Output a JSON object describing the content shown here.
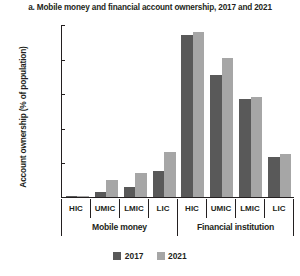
{
  "chart_data": {
    "type": "bar",
    "title": "a. Mobile money and financial account ownership, 2017 and 2021",
    "xlabel": "",
    "ylabel": "Account ownership (% of population)",
    "ylim": [
      0,
      100
    ],
    "yticks": [
      0,
      20,
      40,
      60,
      80,
      100
    ],
    "grid": false,
    "legend_position": "bottom-center",
    "categories": [
      "HIC",
      "UMIC",
      "LMIC",
      "LIC",
      "HIC",
      "UMIC",
      "LMIC",
      "LIC"
    ],
    "groups": [
      {
        "label": "Mobile money",
        "categories": [
          "HIC",
          "UMIC",
          "LMIC",
          "LIC"
        ]
      },
      {
        "label": "Financial institution",
        "categories": [
          "HIC",
          "UMIC",
          "LMIC",
          "LIC"
        ]
      }
    ],
    "series": [
      {
        "name": "2017",
        "color": "#595959",
        "values": [
          0.5,
          3,
          6,
          15,
          94,
          71,
          57,
          23
        ]
      },
      {
        "name": "2021",
        "color": "#a6a6a6",
        "values": [
          0.7,
          10,
          14,
          26,
          96,
          81,
          58,
          25
        ]
      }
    ],
    "bars": [
      {
        "group": "Mobile money",
        "category": "HIC",
        "y2017": 0.5,
        "y2021": 0.7
      },
      {
        "group": "Mobile money",
        "category": "UMIC",
        "y2017": 3,
        "y2021": 10
      },
      {
        "group": "Mobile money",
        "category": "LMIC",
        "y2017": 6,
        "y2021": 14
      },
      {
        "group": "Mobile money",
        "category": "LIC",
        "y2017": 15,
        "y2021": 26
      },
      {
        "group": "Financial institution",
        "category": "HIC",
        "y2017": 94,
        "y2021": 96
      },
      {
        "group": "Financial institution",
        "category": "UMIC",
        "y2017": 71,
        "y2021": 81
      },
      {
        "group": "Financial institution",
        "category": "LMIC",
        "y2017": 57,
        "y2021": 58
      },
      {
        "group": "Financial institution",
        "category": "LIC",
        "y2017": 23,
        "y2021": 25
      }
    ]
  },
  "axis": {
    "ytick_labels": [
      "100",
      "80",
      "60",
      "40",
      "20",
      "0"
    ],
    "ylabel_text": "Account ownership (% of population)"
  },
  "categories_labels": {
    "c0": "HIC",
    "c1": "UMIC",
    "c2": "LMIC",
    "c3": "LIC",
    "c4": "HIC",
    "c5": "UMIC",
    "c6": "LMIC",
    "c7": "LIC"
  },
  "group_labels": {
    "g0": "Mobile money",
    "g1": "Financial institution"
  },
  "legend": {
    "items": [
      {
        "label": "2017",
        "color": "#595959"
      },
      {
        "label": "2021",
        "color": "#a6a6a6"
      }
    ],
    "label_2017": "2017",
    "label_2021": "2021"
  },
  "title": "a. Mobile money and financial account ownership, 2017 and 2021"
}
